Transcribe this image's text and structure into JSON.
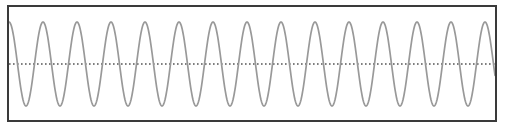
{
  "figure": {
    "title": "",
    "background_color": "#ffffff",
    "frame": {
      "x": 7,
      "y": 5,
      "width": 490,
      "height": 117,
      "border_color": "#3a3a3a",
      "border_width": 2
    }
  },
  "chart_data": {
    "type": "line",
    "title": "",
    "subtitle": "",
    "xlabel": "",
    "ylabel": "",
    "xlim": [
      0,
      490
    ],
    "ylim": [
      -1.15,
      1.15
    ],
    "grid": false,
    "legend_position": "none",
    "xticks": [],
    "yticks": [],
    "xtick_labels": [],
    "ytick_labels": [],
    "annotations": [],
    "series": [
      {
        "name": "sine-waveform",
        "color": "#999999",
        "line_width": 1.6,
        "line_style": "solid",
        "waveform": "sine",
        "amplitude": 1.0,
        "period_px": 34.0,
        "cycles_visible": 13.4,
        "phase_deg": 90,
        "peak_top_y_px": 22,
        "trough_bottom_y_px": 106,
        "samples_x": [
          0,
          8.5,
          17,
          25.5,
          34,
          42.5,
          51,
          59.5,
          68,
          76.5,
          85,
          93.5,
          102
        ],
        "samples_y": [
          1,
          0,
          -1,
          0,
          1,
          0,
          -1,
          0,
          1,
          0,
          -1,
          0,
          1
        ]
      },
      {
        "name": "zero-reference-line",
        "color": "#555555",
        "line_width": 1,
        "line_style": "dotted",
        "value": 0,
        "orientation": "horizontal",
        "y_px": 64
      }
    ]
  }
}
